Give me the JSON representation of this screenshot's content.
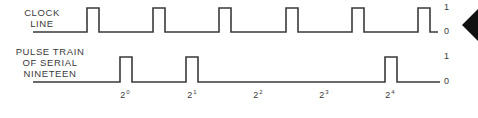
{
  "diagram": {
    "clock": {
      "label_lines": [
        "CLOCK",
        "LINE"
      ],
      "high_label": "1",
      "low_label": "0",
      "pulses_x": [
        87,
        153,
        219,
        286,
        352,
        418
      ],
      "pulse_width": 12,
      "line_start_x": 33,
      "line_end_x": 438,
      "y_high": 8,
      "y_low": 32
    },
    "serial": {
      "label_lines": [
        "PULSE TRAIN",
        "OF SERIAL",
        "NINETEEN"
      ],
      "high_label": "1",
      "low_label": "0",
      "value": 19,
      "binary": "10011",
      "pulses_x": [
        120,
        186,
        385
      ],
      "pulse_width": 12,
      "line_start_x": 33,
      "line_end_x": 440,
      "y_high": 57,
      "y_low": 82,
      "bit_labels": [
        {
          "base": "2",
          "exp": "0",
          "x": 125
        },
        {
          "base": "2",
          "exp": "1",
          "x": 192
        },
        {
          "base": "2",
          "exp": "2",
          "x": 258
        },
        {
          "base": "2",
          "exp": "3",
          "x": 324
        },
        {
          "base": "2",
          "exp": "4",
          "x": 390
        }
      ]
    },
    "colors": {
      "line": "#3a3a3a",
      "marker": "#111111"
    }
  }
}
